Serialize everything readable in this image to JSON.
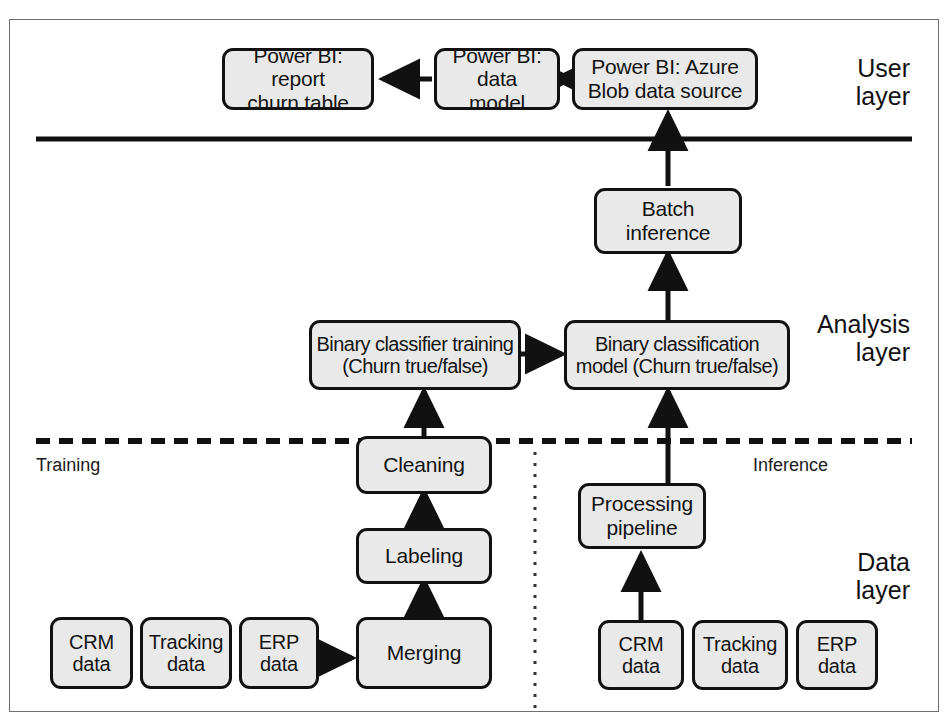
{
  "figure": {
    "background": "#ffffff",
    "frame_color": "#6e6e6e",
    "node_fill": "#e9e9e9",
    "node_stroke": "#111111"
  },
  "layers": [
    {
      "id": "user",
      "label": "User\nlayer"
    },
    {
      "id": "analysis",
      "label": "Analysis\nlayer"
    },
    {
      "id": "data",
      "label": "Data\nlayer"
    }
  ],
  "dividers": {
    "user_analysis": {
      "style": "solid"
    },
    "analysis_data": {
      "style": "dashed"
    },
    "train_infer": {
      "style": "dotted"
    }
  },
  "side_labels": {
    "training": "Training",
    "inference": "Inference"
  },
  "nodes": {
    "pbi_report": "Power BI: report\nchurn table",
    "pbi_model": "Power BI: data\nmodel",
    "pbi_source": "Power BI: Azure\nBlob data source",
    "batch_inference": "Batch inference",
    "classifier_training": "Binary classifier training\n(Churn true/false)",
    "classification_model": "Binary classification\nmodel (Churn true/false)",
    "cleaning": "Cleaning",
    "labeling": "Labeling",
    "merging": "Merging",
    "processing_pipeline": "Processing\npipeline",
    "train_crm": "CRM\ndata",
    "train_tracking": "Tracking\ndata",
    "train_erp": "ERP\ndata",
    "infer_crm": "CRM\ndata",
    "infer_tracking": "Tracking\ndata",
    "infer_erp": "ERP\ndata"
  },
  "edges": [
    {
      "from": "pbi_model",
      "to": "pbi_report",
      "direction": "left"
    },
    {
      "from": "pbi_source",
      "to": "pbi_model",
      "direction": "left"
    },
    {
      "from": "batch_inference",
      "to": "pbi_source",
      "direction": "up"
    },
    {
      "from": "classification_model",
      "to": "batch_inference",
      "direction": "up"
    },
    {
      "from": "classifier_training",
      "to": "classification_model",
      "direction": "right"
    },
    {
      "from": "cleaning",
      "to": "classifier_training",
      "direction": "up"
    },
    {
      "from": "labeling",
      "to": "cleaning",
      "direction": "up"
    },
    {
      "from": "merging",
      "to": "labeling",
      "direction": "up"
    },
    {
      "from": "train_erp",
      "to": "merging",
      "direction": "right"
    },
    {
      "from": "processing_pipeline",
      "to": "classification_model",
      "direction": "up"
    },
    {
      "from": "infer_crm",
      "to": "processing_pipeline",
      "direction": "up"
    }
  ]
}
